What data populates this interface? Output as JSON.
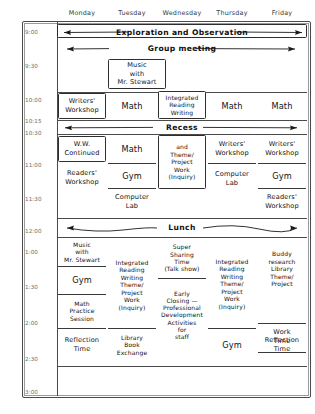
{
  "header": {
    "days": [
      "Monday",
      "Tuesday",
      "Wednesday",
      "Thursday",
      "Friday"
    ]
  },
  "time_labels": [
    "9:00",
    "9:30",
    "10:00",
    "10:15",
    "10:30",
    "11:00",
    "11:30",
    "12:00",
    "1:00",
    "1:30",
    "2:00",
    "2:30",
    "3:00"
  ],
  "banners": [
    {
      "label": "Exploration and Observation"
    },
    {
      "label": "Group meeting"
    },
    {
      "label": "Recess"
    },
    {
      "label": "Lunch"
    }
  ],
  "blocks": {
    "music_morning": "Music\nwith\nMr. Stewart",
    "mon_writers": "Writers'\nWorkshop",
    "tue_math_1": "Math",
    "wed_integrated": "Integrated\nReading\nWriting",
    "thu_math_1": "Math",
    "fri_math_1": "Math",
    "mon_ww_cont": "W.W.\nContinued",
    "tue_math_2": "Math",
    "wed_theme": "and\nTheme/\nProject\nWork\n(Inquiry)",
    "thu_writers": "Writers'\nWorkshop",
    "fri_writers": "Writers'\nWorkshop",
    "mon_readers": "Readers'\nWorkshop",
    "tue_gym": "Gym",
    "tue_computer": "Computer\nLab",
    "thu_computer": "Computer\nLab",
    "fri_gym": "Gym",
    "fri_readers": "Readers'\nWorkshop",
    "mon_music_pm": "Music\nwith\nMr. Stewart",
    "mon_gym_pm": "Gym",
    "mon_math_practice": "Math\nPractice\nSession",
    "mon_reflection": "Reflection\nTime",
    "tue_integrated_pm": "Integrated\nReading\nWriting\nTheme/\nProject\nWork\n(Inquiry)",
    "tue_library": "Library\nBook\nExchange",
    "wed_super_sharing": "Super\nSharing\nTime\n(Talk show)",
    "wed_early_closing": "Early\nClosing —\nProfessional\nDevelopment\nActivities\nfor\nstaff",
    "thu_integrated_pm": "Integrated\nReading\nWriting\nTheme/\nProject\nWork\n(Inquiry)",
    "thu_gym_pm": "Gym",
    "fri_buddy": "Buddy\nresearch\nLibrary\nTheme/\nProject",
    "fri_work_time": "Work\nTime",
    "fri_reflection": "Reflection\nTime"
  }
}
